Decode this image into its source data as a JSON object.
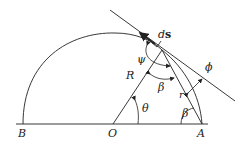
{
  "diagram": {
    "labels": {
      "B": "B",
      "O": "O",
      "A": "A",
      "R": "R",
      "r": "r",
      "theta": "θ",
      "beta_mid": "β",
      "beta_A": "β",
      "psi": "ψ",
      "phi": "ϕ",
      "ds_d": "d",
      "ds_s": "s"
    },
    "colors": {
      "stroke": "#222222",
      "background": "#ffffff"
    }
  }
}
